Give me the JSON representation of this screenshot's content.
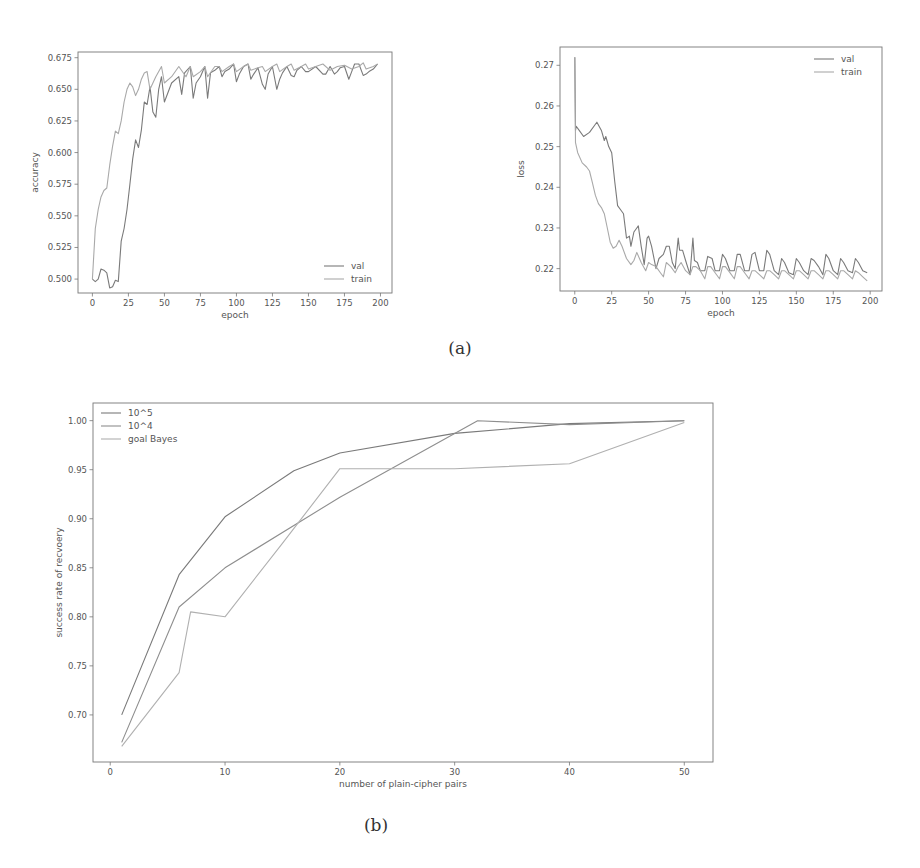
{
  "captions": {
    "a": "(a)",
    "b": "(b)"
  },
  "chart_data": [
    {
      "id": "accuracy",
      "type": "line",
      "title": "",
      "xlabel": "epoch",
      "ylabel": "accuracy",
      "xlim": [
        -10,
        208
      ],
      "ylim": [
        0.489,
        0.6795
      ],
      "xticks": [
        0,
        25,
        50,
        75,
        100,
        125,
        150,
        175,
        200
      ],
      "yticks": [
        0.5,
        0.525,
        0.55,
        0.575,
        0.6,
        0.625,
        0.65,
        0.675
      ],
      "ytick_labels": [
        "0.500",
        "0.525",
        "0.550",
        "0.575",
        "0.600",
        "0.625",
        "0.650",
        "0.675"
      ],
      "grid": false,
      "legend_position": "lower right",
      "series": [
        {
          "name": "val",
          "color": "#7a7a7a",
          "x": [
            0,
            2,
            4,
            6,
            8,
            10,
            12,
            14,
            16,
            18,
            20,
            22,
            24,
            26,
            28,
            30,
            32,
            34,
            36,
            38,
            40,
            42,
            44,
            46,
            48,
            50,
            55,
            60,
            62,
            64,
            68,
            70,
            72,
            75,
            78,
            80,
            82,
            85,
            88,
            90,
            92,
            95,
            98,
            100,
            102,
            105,
            108,
            110,
            112,
            115,
            118,
            120,
            122,
            125,
            128,
            130,
            132,
            135,
            138,
            140,
            142,
            145,
            148,
            150,
            155,
            160,
            162,
            165,
            168,
            170,
            172,
            175,
            178,
            180,
            182,
            185,
            188,
            190,
            192,
            195,
            198
          ],
          "y": [
            0.5,
            0.498,
            0.5,
            0.508,
            0.507,
            0.505,
            0.493,
            0.494,
            0.499,
            0.498,
            0.53,
            0.54,
            0.555,
            0.575,
            0.595,
            0.61,
            0.604,
            0.618,
            0.64,
            0.638,
            0.652,
            0.632,
            0.628,
            0.65,
            0.66,
            0.64,
            0.655,
            0.66,
            0.646,
            0.663,
            0.668,
            0.643,
            0.655,
            0.66,
            0.668,
            0.643,
            0.663,
            0.665,
            0.668,
            0.66,
            0.664,
            0.666,
            0.67,
            0.656,
            0.662,
            0.668,
            0.67,
            0.658,
            0.662,
            0.667,
            0.654,
            0.65,
            0.662,
            0.668,
            0.65,
            0.658,
            0.663,
            0.668,
            0.661,
            0.66,
            0.665,
            0.668,
            0.664,
            0.664,
            0.668,
            0.662,
            0.662,
            0.668,
            0.662,
            0.664,
            0.667,
            0.668,
            0.658,
            0.664,
            0.67,
            0.67,
            0.661,
            0.662,
            0.664,
            0.666,
            0.67
          ]
        },
        {
          "name": "train",
          "color": "#a9a9a9",
          "x": [
            0,
            2,
            4,
            6,
            8,
            10,
            12,
            14,
            16,
            18,
            20,
            22,
            24,
            26,
            28,
            30,
            32,
            34,
            36,
            38,
            40,
            44,
            48,
            50,
            55,
            60,
            65,
            68,
            70,
            75,
            78,
            80,
            85,
            88,
            90,
            95,
            98,
            100,
            105,
            108,
            110,
            115,
            118,
            120,
            125,
            128,
            130,
            135,
            138,
            140,
            145,
            148,
            150,
            155,
            160,
            165,
            170,
            175,
            180,
            185,
            188,
            190,
            195,
            198
          ],
          "y": [
            0.5,
            0.54,
            0.555,
            0.565,
            0.57,
            0.572,
            0.59,
            0.605,
            0.617,
            0.615,
            0.625,
            0.64,
            0.65,
            0.655,
            0.652,
            0.645,
            0.65,
            0.658,
            0.663,
            0.664,
            0.65,
            0.66,
            0.668,
            0.655,
            0.66,
            0.668,
            0.66,
            0.668,
            0.66,
            0.664,
            0.668,
            0.66,
            0.668,
            0.668,
            0.664,
            0.668,
            0.67,
            0.664,
            0.668,
            0.67,
            0.665,
            0.667,
            0.668,
            0.664,
            0.668,
            0.67,
            0.664,
            0.668,
            0.67,
            0.665,
            0.668,
            0.67,
            0.666,
            0.668,
            0.67,
            0.665,
            0.668,
            0.669,
            0.666,
            0.668,
            0.671,
            0.666,
            0.668,
            0.67
          ]
        }
      ]
    },
    {
      "id": "loss",
      "type": "line",
      "title": "",
      "xlabel": "epoch",
      "ylabel": "loss",
      "xlim": [
        -10,
        208
      ],
      "ylim": [
        0.2145,
        0.2745
      ],
      "xticks": [
        0,
        25,
        50,
        75,
        100,
        125,
        150,
        175,
        200
      ],
      "yticks": [
        0.22,
        0.23,
        0.24,
        0.25,
        0.26,
        0.27
      ],
      "ytick_labels": [
        "0.22",
        "0.23",
        "0.24",
        "0.25",
        "0.26",
        "0.27"
      ],
      "grid": false,
      "legend_position": "upper right",
      "series": [
        {
          "name": "val",
          "color": "#7a7a7a",
          "x": [
            0,
            0.5,
            1,
            3,
            6,
            10,
            14,
            15,
            18,
            20,
            21,
            23,
            25,
            27,
            29,
            31,
            33,
            35,
            37,
            38,
            40,
            42,
            43,
            45,
            47,
            49,
            50,
            52,
            55,
            57,
            60,
            62,
            64,
            66,
            68,
            70,
            71,
            73,
            75,
            78,
            80,
            81,
            83,
            85,
            88,
            90,
            93,
            95,
            98,
            100,
            102,
            105,
            108,
            110,
            112,
            115,
            118,
            120,
            122,
            125,
            128,
            130,
            132,
            135,
            138,
            140,
            142,
            145,
            148,
            150,
            152,
            155,
            158,
            160,
            162,
            165,
            168,
            170,
            172,
            175,
            178,
            180,
            182,
            185,
            188,
            190,
            192,
            195,
            198
          ],
          "y": [
            0.272,
            0.254,
            0.255,
            0.254,
            0.2525,
            0.2535,
            0.2555,
            0.256,
            0.254,
            0.2515,
            0.2525,
            0.25,
            0.2485,
            0.2415,
            0.2355,
            0.2345,
            0.2335,
            0.2275,
            0.228,
            0.2255,
            0.229,
            0.23,
            0.2305,
            0.2255,
            0.221,
            0.2275,
            0.228,
            0.2255,
            0.22,
            0.2225,
            0.2235,
            0.2255,
            0.2255,
            0.2215,
            0.22,
            0.2275,
            0.2245,
            0.2245,
            0.222,
            0.2185,
            0.2275,
            0.222,
            0.2215,
            0.2195,
            0.2195,
            0.223,
            0.2225,
            0.2195,
            0.2195,
            0.2235,
            0.2225,
            0.2195,
            0.2195,
            0.2235,
            0.2235,
            0.2195,
            0.2195,
            0.2235,
            0.224,
            0.2195,
            0.2195,
            0.2245,
            0.2235,
            0.2195,
            0.2185,
            0.2225,
            0.2215,
            0.219,
            0.2185,
            0.2225,
            0.2215,
            0.2195,
            0.2185,
            0.2225,
            0.222,
            0.2205,
            0.2185,
            0.2235,
            0.2225,
            0.2195,
            0.2185,
            0.2225,
            0.2215,
            0.2195,
            0.219,
            0.2225,
            0.2215,
            0.2195,
            0.219
          ]
        },
        {
          "name": "train",
          "color": "#a9a9a9",
          "x": [
            0,
            0.5,
            2,
            5,
            8,
            10,
            12,
            14,
            16,
            18,
            20,
            22,
            24,
            26,
            28,
            30,
            32,
            35,
            38,
            40,
            42,
            45,
            48,
            50,
            52,
            55,
            58,
            60,
            62,
            65,
            68,
            70,
            72,
            75,
            78,
            80,
            82,
            85,
            88,
            90,
            92,
            95,
            98,
            100,
            102,
            105,
            108,
            110,
            112,
            115,
            118,
            120,
            122,
            125,
            128,
            130,
            132,
            135,
            138,
            140,
            142,
            145,
            148,
            150,
            152,
            155,
            158,
            160,
            162,
            165,
            168,
            170,
            172,
            175,
            178,
            180,
            182,
            185,
            188,
            190,
            192,
            195,
            198
          ],
          "y": [
            0.272,
            0.251,
            0.2485,
            0.246,
            0.245,
            0.244,
            0.241,
            0.238,
            0.236,
            0.235,
            0.2335,
            0.23,
            0.2265,
            0.225,
            0.2255,
            0.227,
            0.2255,
            0.2225,
            0.221,
            0.222,
            0.224,
            0.2215,
            0.2195,
            0.2215,
            0.221,
            0.2205,
            0.219,
            0.218,
            0.2215,
            0.2205,
            0.219,
            0.2205,
            0.2215,
            0.2195,
            0.2185,
            0.2205,
            0.2205,
            0.2195,
            0.2175,
            0.2205,
            0.2205,
            0.219,
            0.2175,
            0.2205,
            0.2205,
            0.219,
            0.2175,
            0.2205,
            0.2205,
            0.219,
            0.2175,
            0.2195,
            0.2195,
            0.2185,
            0.2175,
            0.2195,
            0.2195,
            0.2185,
            0.2175,
            0.2195,
            0.2195,
            0.2185,
            0.2175,
            0.2195,
            0.2195,
            0.2185,
            0.2175,
            0.2195,
            0.2195,
            0.2185,
            0.2175,
            0.2195,
            0.2195,
            0.2185,
            0.2175,
            0.2195,
            0.2195,
            0.2185,
            0.2175,
            0.2195,
            0.219,
            0.218,
            0.217
          ]
        }
      ]
    },
    {
      "id": "recovery",
      "type": "line",
      "title": "",
      "xlabel": "number of plain-cipher pairs",
      "ylabel": "success rate of recvoery",
      "xlim": [
        -1.5,
        52.5
      ],
      "ylim": [
        0.652,
        1.018
      ],
      "xticks": [
        0,
        10,
        20,
        30,
        40,
        50
      ],
      "yticks": [
        0.7,
        0.75,
        0.8,
        0.85,
        0.9,
        0.95,
        1.0
      ],
      "ytick_labels": [
        "0.70",
        "0.75",
        "0.80",
        "0.85",
        "0.90",
        "0.95",
        "1.00"
      ],
      "grid": false,
      "legend_position": "upper left",
      "series": [
        {
          "name": "10^5",
          "color": "#7a7a7a",
          "x": [
            1,
            6,
            10,
            16,
            20,
            30,
            40,
            50
          ],
          "y": [
            0.7,
            0.843,
            0.902,
            0.949,
            0.967,
            0.987,
            0.997,
            1.0
          ]
        },
        {
          "name": "10^4",
          "color": "#8e8e8e",
          "x": [
            1,
            6,
            10,
            20,
            32,
            40,
            50
          ],
          "y": [
            0.672,
            0.81,
            0.85,
            0.922,
            1.0,
            0.996,
            1.0
          ]
        },
        {
          "name": "goal Bayes",
          "color": "#b0b0b0",
          "x": [
            1,
            6,
            7,
            10,
            15,
            20,
            30,
            40,
            50
          ],
          "y": [
            0.668,
            0.743,
            0.805,
            0.8,
            0.875,
            0.951,
            0.951,
            0.956,
            0.998
          ]
        }
      ]
    }
  ]
}
